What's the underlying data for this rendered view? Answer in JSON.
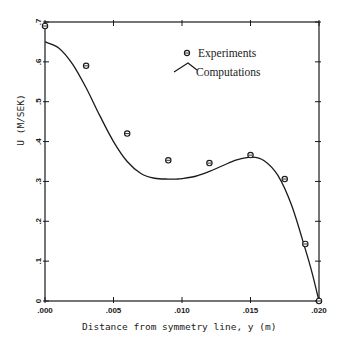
{
  "chart_data": {
    "type": "scatter+line",
    "title": "",
    "xlabel": "Distance from symmetry line, y (m)",
    "ylabel": "U (M/SEK)",
    "xlim": [
      0.0,
      0.02
    ],
    "ylim": [
      0.0,
      0.7
    ],
    "x_ticks": [
      0.0,
      0.005,
      0.01,
      0.015,
      0.02
    ],
    "x_tick_labels": [
      ".000",
      ".005",
      ".010",
      ".015",
      ".020"
    ],
    "y_ticks": [
      0.0,
      0.1,
      0.2,
      0.3,
      0.4,
      0.5,
      0.6,
      0.7
    ],
    "y_tick_labels": [
      "0",
      ".1",
      ".2",
      ".3",
      ".4",
      ".5",
      ".6",
      ".7"
    ],
    "grid": false,
    "legend_position": "upper right",
    "series": [
      {
        "name": "Experiments",
        "kind": "scatter",
        "marker": "circle-with-bar",
        "x": [
          0.0,
          0.003,
          0.006,
          0.009,
          0.012,
          0.015,
          0.0175,
          0.019,
          0.02
        ],
        "y": [
          0.69,
          0.59,
          0.42,
          0.353,
          0.346,
          0.366,
          0.306,
          0.143,
          0.0
        ]
      },
      {
        "name": "Computations",
        "kind": "line",
        "x": [
          0.0,
          0.001,
          0.002,
          0.003,
          0.004,
          0.005,
          0.006,
          0.007,
          0.008,
          0.009,
          0.0096,
          0.01,
          0.011,
          0.012,
          0.013,
          0.014,
          0.0151,
          0.016,
          0.017,
          0.018,
          0.019,
          0.0195,
          0.02
        ],
        "y": [
          0.65,
          0.635,
          0.595,
          0.535,
          0.465,
          0.4,
          0.35,
          0.32,
          0.308,
          0.306,
          0.306,
          0.307,
          0.313,
          0.325,
          0.34,
          0.354,
          0.361,
          0.352,
          0.315,
          0.24,
          0.13,
          0.07,
          0.0
        ]
      }
    ]
  },
  "legend": {
    "experiments_label": "Experiments",
    "computations_label": "Computations"
  },
  "axes": {
    "xlabel": "Distance from symmetry line, y (m)",
    "ylabel": "U (M/SEK)"
  }
}
